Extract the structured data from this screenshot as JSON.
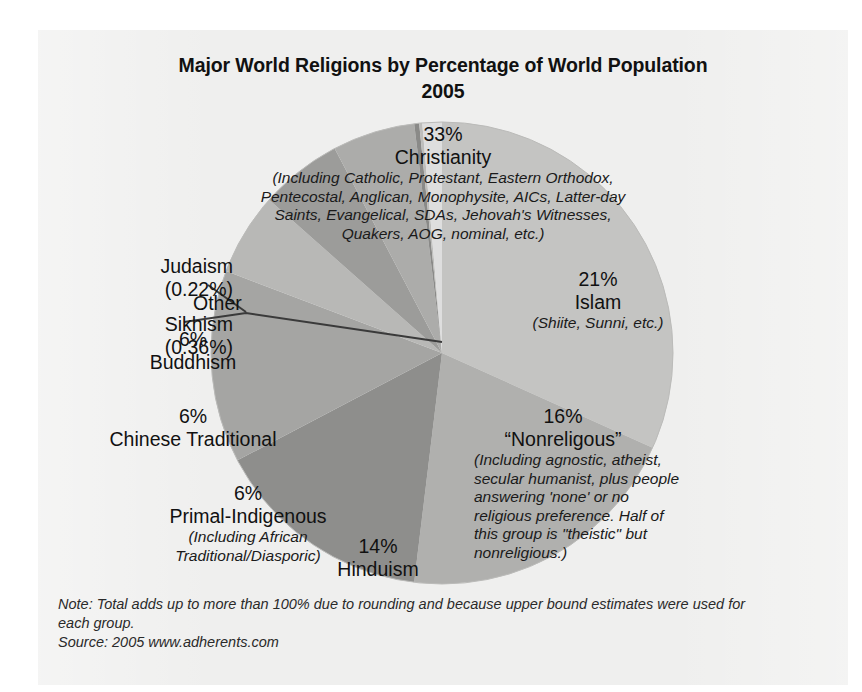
{
  "chart_data": {
    "type": "pie",
    "title": "Major World Religions by Percentage of World Population",
    "subtitle": "2005",
    "xlabel": "",
    "ylabel": "",
    "legend_position": "none",
    "grid": false,
    "categories": [
      "Christianity",
      "Islam",
      "\"Nonreligous\"",
      "Hinduism",
      "Primal-Indigenous",
      "Chinese Traditional",
      "Buddhism",
      "Other",
      "Sikhism",
      "Judaism"
    ],
    "values": [
      33,
      21,
      16,
      14,
      6,
      6,
      6,
      1.42,
      0.36,
      0.22
    ],
    "value_labels": [
      "33%",
      "21%",
      "16%",
      "14%",
      "6%",
      "6%",
      "6%",
      "",
      "(0.36%)",
      "(0.22%)"
    ],
    "colors": [
      "#c4c4c2",
      "#b0b0ae",
      "#8e8e8c",
      "#a5a5a3",
      "#b8b8b6",
      "#9c9c9a",
      "#acacaa",
      "#dedede",
      "#8a8a88",
      "#bdbdbb"
    ],
    "slices": [
      {
        "name": "Christianity",
        "percent": 33,
        "label": "33%",
        "color": "#c4c4c2"
      },
      {
        "name": "Islam",
        "percent": 21,
        "label": "21%",
        "color": "#b0b0ae"
      },
      {
        "name": "\"Nonreligous\"",
        "percent": 16,
        "label": "16%",
        "color": "#8e8e8c"
      },
      {
        "name": "Hinduism",
        "percent": 14,
        "label": "14%",
        "color": "#a5a5a3"
      },
      {
        "name": "Primal-Indigenous",
        "percent": 6,
        "label": "6%",
        "color": "#b8b8b6"
      },
      {
        "name": "Chinese Traditional",
        "percent": 6,
        "label": "6%",
        "color": "#9c9c9a"
      },
      {
        "name": "Buddhism",
        "percent": 6,
        "label": "6%",
        "color": "#acacaa"
      },
      {
        "name": "Sikhism",
        "percent": 0.36,
        "label": "(0.36%)",
        "color": "#8a8a88"
      },
      {
        "name": "Judaism",
        "percent": 0.22,
        "label": "(0.22%)",
        "color": "#bdbdbb"
      },
      {
        "name": "Other",
        "percent": 1.42,
        "label": "",
        "color": "#dedede"
      }
    ],
    "note": "Total adds up to more than 100% due to rounding and because upper bound estimates were used for each group.",
    "source": "2005 www.adherents.com"
  },
  "title": {
    "line1": "Major World Religions by Percentage of World Population",
    "line2": "2005"
  },
  "labels": {
    "christianity": {
      "percent": "33%",
      "name": "Christianity",
      "detail": "(Including Catholic, Protestant, Eastern Orthodox, Pentecostal, Anglican, Monophysite, AICs, Latter-day Saints, Evangelical, SDAs, Jehovah's Witnesses, Quakers, AOG, nominal, etc.)"
    },
    "islam": {
      "percent": "21%",
      "name": "Islam",
      "detail": "(Shiite, Sunni, etc.)"
    },
    "nonreligious": {
      "percent": "16%",
      "name": "“Nonreligous”",
      "detail": "(Including agnostic, atheist, secular humanist, plus people answering 'none' or no religious preference. Half of this group is \"theistic\" but nonreligious.)"
    },
    "hinduism": {
      "percent": "14%",
      "name": "Hinduism"
    },
    "primal": {
      "percent": "6%",
      "name": "Primal-Indigenous",
      "detail": "(Including African Traditional/Diasporic)"
    },
    "chinese": {
      "percent": "6%",
      "name": "Chinese Traditional"
    },
    "buddhism": {
      "percent": "6%",
      "name": "Buddhism"
    },
    "other": {
      "name": "Other"
    },
    "judaism": {
      "name": "Judaism",
      "percent": "(0.22%)"
    },
    "sikhism": {
      "name": "Sikhism",
      "percent": "(0.36%)"
    }
  },
  "footnote": {
    "note_line1": "Note: Total adds up to more than 100% due to rounding and because upper bound estimates were used for",
    "note_line2": "each group.",
    "source_line": "Source: 2005 www.adherents.com"
  }
}
